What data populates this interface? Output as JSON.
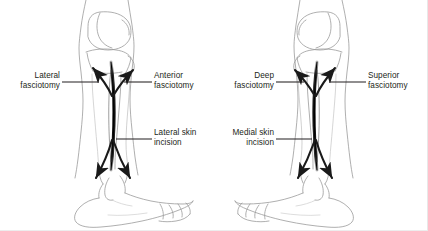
{
  "figure": {
    "background_color": "#ffffff",
    "ink_color": "#231f20",
    "outline_color": "#8d8d8d",
    "incision_color": "#1a1a1a"
  },
  "panels": [
    {
      "id": "lateral-approach",
      "name": "Lateral approach",
      "view": "lateral view of right lower leg, foot pointing right",
      "incision": {
        "name": "lateral-skin-incision",
        "label": "Lateral skin\nincision",
        "orientation": "vertical, mid-calf"
      },
      "labels": [
        {
          "id": "lateral-fasciotomy",
          "text": "Lateral\nfasciotomy",
          "side": "left",
          "leader": "horizontal line to upper-left arrow"
        },
        {
          "id": "anterior-fasciotomy",
          "text": "Anterior\nfasciotomy",
          "side": "right",
          "leader": "horizontal line to upper-right arrow"
        },
        {
          "id": "lateral-skin-incision",
          "text": "Lateral skin\nincision",
          "side": "right",
          "leader": "horizontal line to mid incision"
        }
      ],
      "arrows": [
        {
          "id": "arrow-up-left",
          "direction": "up-left"
        },
        {
          "id": "arrow-up-right",
          "direction": "up-right"
        },
        {
          "id": "arrow-down-left",
          "direction": "down-left"
        },
        {
          "id": "arrow-down-right",
          "direction": "down-right"
        }
      ]
    },
    {
      "id": "medial-approach",
      "name": "Medial approach",
      "view": "medial view of lower leg, foot pointing left",
      "incision": {
        "name": "medial-skin-incision",
        "label": "Medial skin\nincision",
        "orientation": "vertical, mid-calf"
      },
      "labels": [
        {
          "id": "deep-fasciotomy",
          "text": "Deep\nfasciotomy",
          "side": "left",
          "leader": "horizontal line to upper-left arrow"
        },
        {
          "id": "superior-fasciotomy",
          "text": "Superior\nfasciotomy",
          "side": "right",
          "leader": "horizontal line to upper-right arrow"
        },
        {
          "id": "medial-skin-incision",
          "text": "Medial skin\nincision",
          "side": "left",
          "leader": "horizontal line to mid incision"
        }
      ],
      "arrows": [
        {
          "id": "arrow-up-left",
          "direction": "up-left"
        },
        {
          "id": "arrow-up-right",
          "direction": "up-right"
        },
        {
          "id": "arrow-down-left",
          "direction": "down-left"
        },
        {
          "id": "arrow-down-right",
          "direction": "down-right"
        }
      ]
    }
  ]
}
